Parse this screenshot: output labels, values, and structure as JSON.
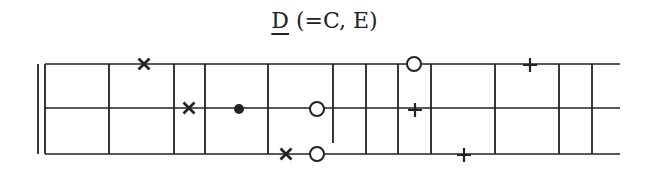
{
  "title": {
    "key": "D",
    "equivalents": " (=C, E)"
  },
  "diagram": {
    "type": "fretboard-chart",
    "strings": 3,
    "line_color": "#222222",
    "string_y": [
      64,
      108,
      154
    ],
    "left_double_bar_x": [
      38,
      45
    ],
    "frets": [
      {
        "x": 45,
        "y1": 64,
        "y2": 154
      },
      {
        "x": 109,
        "y1": 64,
        "y2": 154
      },
      {
        "x": 174,
        "y1": 64,
        "y2": 154
      },
      {
        "x": 205,
        "y1": 64,
        "y2": 154
      },
      {
        "x": 268,
        "y1": 64,
        "y2": 154
      },
      {
        "x": 333,
        "y1": 64,
        "y2": 143
      },
      {
        "x": 366,
        "y1": 64,
        "y2": 154
      },
      {
        "x": 398,
        "y1": 64,
        "y2": 154
      },
      {
        "x": 431,
        "y1": 64,
        "y2": 154
      },
      {
        "x": 495,
        "y1": 64,
        "y2": 154
      },
      {
        "x": 559,
        "y1": 64,
        "y2": 154
      },
      {
        "x": 592,
        "y1": 64,
        "y2": 154
      }
    ],
    "string_end_x": 620,
    "markers": [
      {
        "symbol": "cross",
        "x": 144,
        "y": 64
      },
      {
        "symbol": "cross",
        "x": 189,
        "y": 108
      },
      {
        "symbol": "dot",
        "x": 239,
        "y": 109
      },
      {
        "symbol": "circle",
        "x": 317,
        "y": 109
      },
      {
        "symbol": "cross",
        "x": 286,
        "y": 154
      },
      {
        "symbol": "circle",
        "x": 317,
        "y": 154
      },
      {
        "symbol": "circle",
        "x": 414,
        "y": 64
      },
      {
        "symbol": "plus",
        "x": 415,
        "y": 110
      },
      {
        "symbol": "plus",
        "x": 530,
        "y": 65
      },
      {
        "symbol": "plus",
        "x": 464,
        "y": 155
      }
    ]
  }
}
